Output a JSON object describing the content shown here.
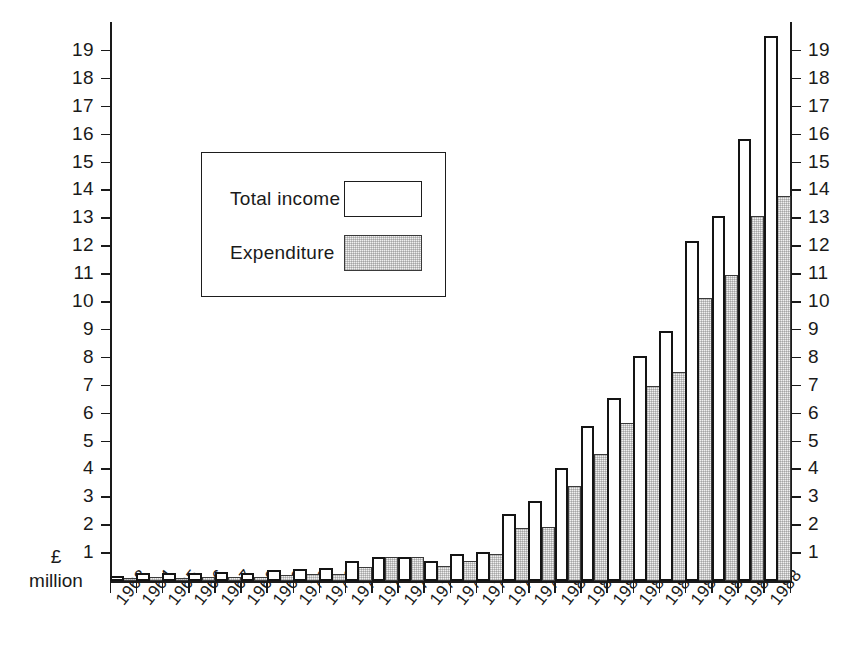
{
  "chart_data": {
    "type": "bar",
    "title": "",
    "subtitle": "",
    "xlabel": "",
    "ylabel": "£ million",
    "ylabel_lines": [
      "£",
      "million"
    ],
    "ylim": [
      0,
      19.6
    ],
    "ytick_step": 1,
    "grid": false,
    "legend_position": "upper-left-inset",
    "axis_left_ticks": [
      "19",
      "18",
      "17",
      "16",
      "15",
      "14",
      "13",
      "12",
      "11",
      "10",
      "9",
      "8",
      "7",
      "6",
      "5",
      "4",
      "3",
      "2",
      "1"
    ],
    "axis_right_ticks": [
      "19",
      "18",
      "17",
      "16",
      "15",
      "14",
      "13",
      "12",
      "11",
      "10",
      "9",
      "8",
      "7",
      "6",
      "5",
      "4",
      "3",
      "2",
      "1"
    ],
    "categories": [
      "1963",
      "1964",
      "1965",
      "1966",
      "1967",
      "1968",
      "1969",
      "1970",
      "1971",
      "1972",
      "1973",
      "1974",
      "1975",
      "1976",
      "1977",
      "1978",
      "1979",
      "1980",
      "1981",
      "1982",
      "1983",
      "1984",
      "1985",
      "1986",
      "1987",
      "1988"
    ],
    "series": [
      {
        "name": "Total income",
        "style": "outline",
        "values": [
          0.18,
          0.3,
          0.28,
          0.3,
          0.33,
          0.3,
          0.4,
          0.42,
          0.48,
          0.7,
          0.85,
          0.85,
          0.7,
          0.95,
          1.05,
          2.4,
          2.85,
          4.05,
          5.55,
          6.55,
          8.05,
          8.95,
          12.2,
          13.1,
          15.85,
          19.55
        ]
      },
      {
        "name": "Expenditure",
        "style": "stippled",
        "values": [
          0.12,
          0.14,
          0.12,
          0.14,
          0.15,
          0.14,
          0.22,
          0.24,
          0.26,
          0.5,
          0.85,
          0.85,
          0.55,
          0.72,
          0.95,
          1.9,
          1.95,
          3.4,
          4.55,
          5.65,
          7.0,
          7.5,
          10.15,
          10.95,
          13.1,
          13.8
        ]
      }
    ],
    "legend": [
      {
        "label": "Total income",
        "swatch": "outline-white-box"
      },
      {
        "label": "Expenditure",
        "swatch": "stippled-grey-box"
      }
    ],
    "colors": {
      "income_fill": "#ffffff",
      "income_stroke": "#141414",
      "expenditure_fill": "#f0f0f0",
      "expenditure_stroke": "#3a3a3a",
      "axis": "#1a1a1a",
      "background": "#ffffff"
    }
  }
}
